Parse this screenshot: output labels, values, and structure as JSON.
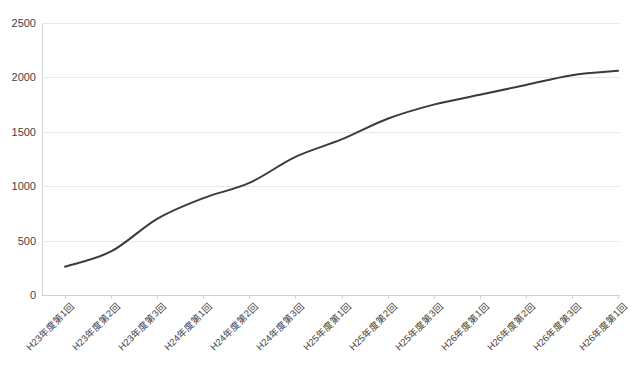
{
  "chart_data": {
    "type": "line",
    "title": "",
    "xlabel": "",
    "ylabel": "",
    "ylim": [
      0,
      2500
    ],
    "yticks": [
      0,
      500,
      1000,
      1500,
      2000,
      2500
    ],
    "grid": true,
    "legend": false,
    "legend_position": "none",
    "line_color": "#3b3b3b",
    "background_color": "#ffffff",
    "gridline_color": "#e8e8e8",
    "axis_color": "#d2d2d2",
    "categories": [
      "H23年度第1回",
      "H23年度第2回",
      "H23年度第3回",
      "H24年度第1回",
      "H24年度第2回",
      "H24年度第3回",
      "H25年度第1回",
      "H25年度第2回",
      "H25年度第3回",
      "H26年度第1回",
      "H26年度第2回",
      "H26年度第3回",
      "H26年度第1回"
    ],
    "values": [
      260,
      400,
      700,
      890,
      1030,
      1270,
      1430,
      1620,
      1750,
      1840,
      1930,
      2020,
      2060
    ],
    "series": [
      {
        "name": "累計",
        "values": [
          260,
          400,
          700,
          890,
          1030,
          1270,
          1430,
          1620,
          1750,
          1840,
          1930,
          2020,
          2060
        ]
      }
    ]
  },
  "axis": {
    "y_tick_labels": [
      "2500",
      "2000",
      "1500",
      "1000",
      "500",
      "0"
    ]
  }
}
